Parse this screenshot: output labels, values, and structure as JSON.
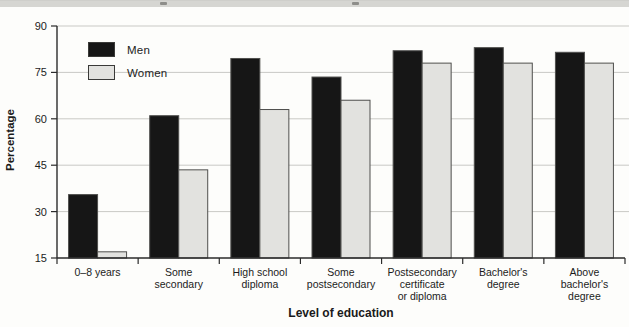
{
  "chart_data": {
    "type": "bar",
    "title": "",
    "xlabel": "Level of education",
    "ylabel": "Percentage",
    "ylim": [
      15,
      90
    ],
    "yticks": [
      15,
      30,
      45,
      60,
      75,
      90
    ],
    "grid": true,
    "legend_position": "upper-left-inside",
    "categories": [
      "0–8 years",
      "Some secondary",
      "High school diploma",
      "Some postsecondary",
      "Postsecondary certificate or diploma",
      "Bachelor's degree",
      "Above bachelor's degree"
    ],
    "category_lines": [
      [
        "0–8 years"
      ],
      [
        "Some",
        "secondary"
      ],
      [
        "High school",
        "diploma"
      ],
      [
        "Some",
        "postsecondary"
      ],
      [
        "Postsecondary",
        "certificate",
        "or diploma"
      ],
      [
        "Bachelor's",
        "degree"
      ],
      [
        "Above",
        "bachelor's",
        "degree"
      ]
    ],
    "series": [
      {
        "name": "Men",
        "color": "#161616",
        "values": [
          35.5,
          61,
          79.5,
          73.5,
          82,
          83,
          81.5
        ]
      },
      {
        "name": "Women",
        "color": "#e2e2df",
        "values": [
          17,
          43.5,
          63,
          66,
          78,
          78,
          78
        ]
      }
    ]
  },
  "colors": {
    "background": "#fdfdfb",
    "top_band": "#d6d6d2",
    "gridline": "#c9c9c5",
    "axis": "#2b2b2b",
    "bar_border": "#4f4f4d",
    "tick_text": "#1c1c1c"
  }
}
